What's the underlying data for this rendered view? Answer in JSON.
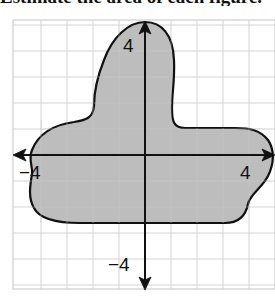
{
  "heading": {
    "text": "Estimate the area of each figure."
  },
  "graph": {
    "x_axis_positive_label": "4",
    "x_axis_negative_label": "−4",
    "y_axis_positive_label": "4",
    "y_axis_negative_label": "−4",
    "grid_units": 10,
    "colors": {
      "grid": "#cfcfcf",
      "shape_fill": "#bdbdbd",
      "shape_stroke": "#111111",
      "axes": "#111111"
    }
  }
}
